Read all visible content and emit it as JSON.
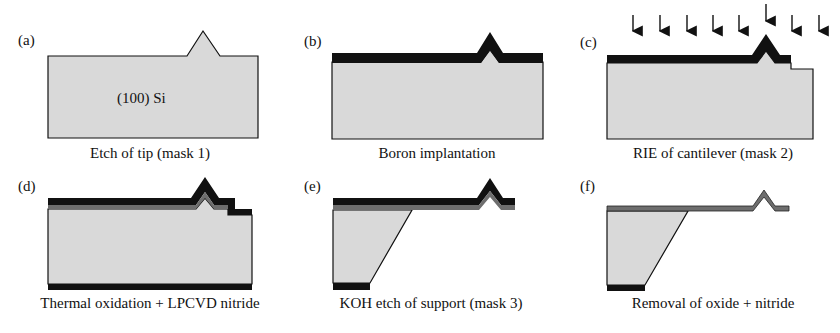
{
  "figure": {
    "colors": {
      "silicon": "#d9d9d9",
      "boron_layer": "#111111",
      "oxide_layer": "#6e6e6e",
      "outline": "#111111"
    },
    "panels": [
      {
        "id": "a",
        "label": "(a)",
        "caption": "Etch of tip (mask 1)",
        "inner_text": "(100) Si"
      },
      {
        "id": "b",
        "label": "(b)",
        "caption": "Boron implantation"
      },
      {
        "id": "c",
        "label": "(c)",
        "caption": "RIE of cantilever (mask 2)",
        "arrows": 8
      },
      {
        "id": "d",
        "label": "(d)",
        "caption": "Thermal oxidation + LPCVD nitride"
      },
      {
        "id": "e",
        "label": "(e)",
        "caption": "KOH etch of support (mask 3)"
      },
      {
        "id": "f",
        "label": "(f)",
        "caption": "Removal of oxide + nitride"
      }
    ]
  }
}
